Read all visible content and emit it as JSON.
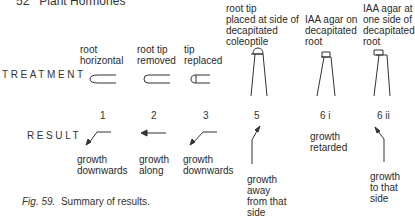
{
  "header": {
    "page_text": "52   Plant Hormones"
  },
  "rows": {
    "treatment_label": "TREATMENT",
    "result_label": "RESULT"
  },
  "experiments": [
    {
      "number": "1",
      "treatment": "root\nhorizontal",
      "result": "growth\ndownwards"
    },
    {
      "number": "2",
      "treatment": "root tip\nremoved",
      "result": "growth\nalong"
    },
    {
      "number": "3",
      "treatment": "tip\nreplaced",
      "result": "growth\ndownwards"
    },
    {
      "number": "5",
      "treatment": "root tip\nplaced at side of\ndecapitated\ncoleoptile",
      "result": "growth\naway\nfrom that\nside"
    },
    {
      "number": "6 i",
      "treatment": "IAA agar on\ndecapitated\nroot",
      "result": "growth\nretarded"
    },
    {
      "number": "6 ii",
      "treatment": "IAA agar at\none side of\ndecapitated\nroot",
      "result": "growth\nto that\nside"
    }
  ],
  "caption": {
    "fig": "Fig. 59.",
    "text": "Summary of results."
  }
}
